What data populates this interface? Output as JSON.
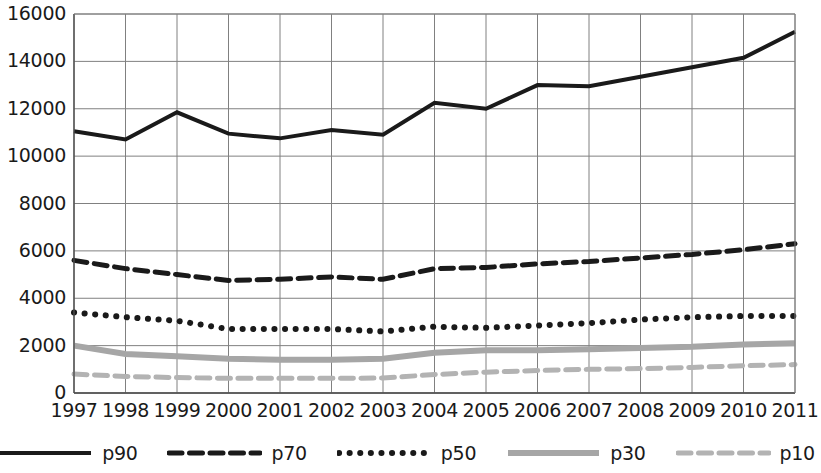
{
  "chart_data": {
    "type": "line",
    "title": "",
    "subtitle": "",
    "xlabel": "",
    "ylabel": "",
    "x": [
      1997,
      1998,
      1999,
      2000,
      2001,
      2002,
      2003,
      2004,
      2005,
      2006,
      2007,
      2008,
      2009,
      2010,
      2011
    ],
    "categories": [
      "1997",
      "1998",
      "1999",
      "2000",
      "2001",
      "2002",
      "2003",
      "2004",
      "2005",
      "2006",
      "2007",
      "2008",
      "2009",
      "2010",
      "2011"
    ],
    "xlim": [
      1997,
      2011
    ],
    "ylim": [
      0,
      16000
    ],
    "yticks": [
      0,
      2000,
      4000,
      6000,
      8000,
      10000,
      12000,
      14000,
      16000
    ],
    "ytick_labels": [
      "0",
      "2000",
      "4000",
      "6000",
      "8000",
      "10000",
      "12000",
      "14000",
      "16000"
    ],
    "grid": true,
    "grid_color": "#808080",
    "legend_position": "bottom",
    "series": [
      {
        "name": "p90",
        "values": [
          11050,
          10700,
          11850,
          10950,
          10750,
          11100,
          10900,
          12250,
          12000,
          13000,
          12950,
          13350,
          13750,
          14150,
          15250
        ],
        "color": "#1a1a1a",
        "style": "solid",
        "width": 4
      },
      {
        "name": "p70",
        "values": [
          5600,
          5250,
          5000,
          4750,
          4800,
          4900,
          4800,
          5250,
          5300,
          5450,
          5550,
          5700,
          5850,
          6050,
          6300
        ],
        "color": "#1a1a1a",
        "style": "dashed",
        "width": 5
      },
      {
        "name": "p50",
        "values": [
          3400,
          3200,
          3050,
          2700,
          2700,
          2700,
          2600,
          2800,
          2750,
          2850,
          2950,
          3100,
          3200,
          3250,
          3250
        ],
        "color": "#1a1a1a",
        "style": "dotted",
        "width": 6
      },
      {
        "name": "p30",
        "values": [
          2000,
          1650,
          1550,
          1450,
          1400,
          1400,
          1450,
          1700,
          1800,
          1800,
          1850,
          1900,
          1950,
          2050,
          2100
        ],
        "color": "#a6a6a6",
        "style": "solid",
        "width": 6
      },
      {
        "name": "p10",
        "values": [
          800,
          700,
          650,
          620,
          620,
          620,
          630,
          780,
          880,
          950,
          1000,
          1030,
          1080,
          1150,
          1200
        ],
        "color": "#b3b3b3",
        "style": "dashed",
        "width": 5
      }
    ]
  },
  "legend": {
    "items": [
      {
        "label": "p90"
      },
      {
        "label": "p70"
      },
      {
        "label": "p50"
      },
      {
        "label": "p30"
      },
      {
        "label": "p10"
      }
    ]
  }
}
